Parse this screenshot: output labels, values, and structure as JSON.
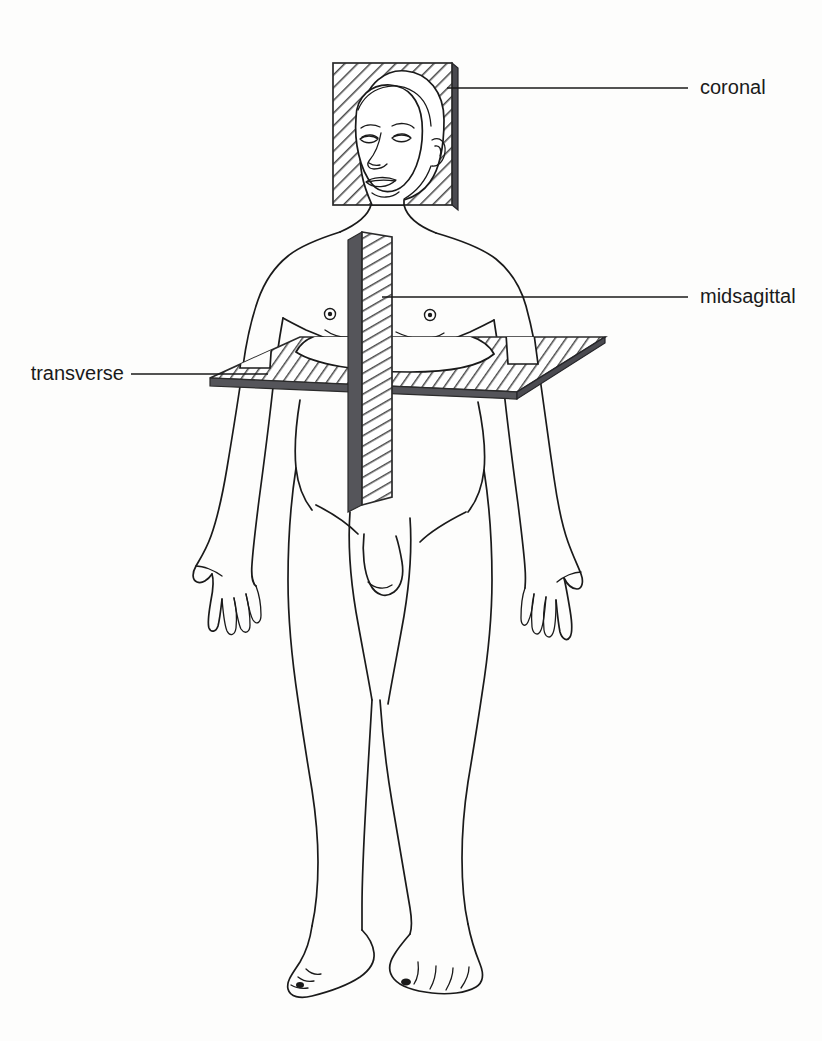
{
  "diagram": {
    "type": "anatomical-plane-diagram",
    "background_color": "#fdfdfc",
    "line_color": "#1a1a1a",
    "plane_hatch_color": "#555555",
    "plane_edge_color": "#55555a"
  },
  "labels": {
    "coronal": {
      "text": "coronal",
      "side": "right",
      "text_x": 700,
      "text_y": 88,
      "leader_from_x": 600,
      "leader_from_y": 88,
      "leader_to_x": 447,
      "leader_to_y": 88
    },
    "midsagittal": {
      "text": "midsagittal",
      "side": "right",
      "text_x": 700,
      "text_y": 297,
      "leader_from_x": 602,
      "leader_from_y": 297,
      "leader_to_x": 382,
      "leader_to_y": 297
    },
    "transverse": {
      "text": "transverse",
      "side": "left",
      "text_x": 122,
      "text_y": 374,
      "leader_from_x": 130,
      "leader_from_y": 374,
      "leader_to_x": 255,
      "leader_to_y": 374
    }
  },
  "planes": [
    {
      "name": "coronal",
      "orientation": "frontal-vertical",
      "shape": "rectangle",
      "bounds": {
        "x": 333,
        "y": 63,
        "width": 125,
        "height": 142
      },
      "hatched": true
    },
    {
      "name": "midsagittal",
      "orientation": "vertical-median",
      "shape": "slab",
      "bounds": {
        "x": 348,
        "y": 232,
        "width": 44,
        "height": 273
      },
      "hatched": true
    },
    {
      "name": "transverse",
      "orientation": "horizontal",
      "shape": "parallelogram",
      "bounds": {
        "x": 210,
        "y": 337,
        "width": 395,
        "height": 55
      },
      "hatched": true
    }
  ],
  "figure_parts": [
    "head",
    "face",
    "ear",
    "neck",
    "shoulders",
    "chest",
    "nipples",
    "navel",
    "arms",
    "hands",
    "fingers",
    "hips",
    "genitals",
    "thighs",
    "knees",
    "shins",
    "ankles",
    "feet",
    "toes"
  ]
}
